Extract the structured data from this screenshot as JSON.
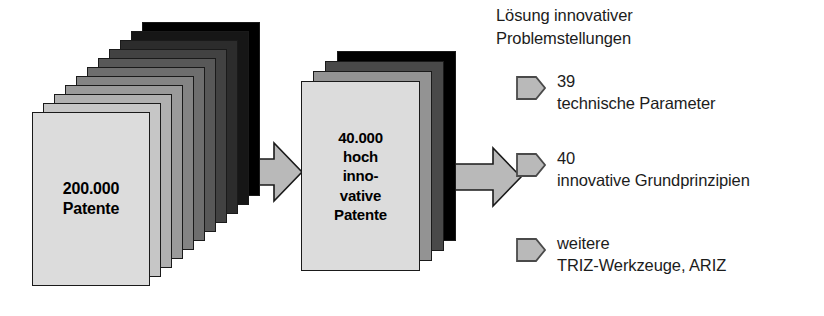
{
  "diagram": {
    "title_text_present": false,
    "background_color": "#ffffff",
    "ink_color": "#1a1a1a"
  },
  "stacks": [
    {
      "id": "patent-stack-large",
      "label": "200.000\nPatente",
      "sheet_count": 11,
      "front_fill": "#dcdcdc",
      "back_fill": "#000000",
      "font_size": 16,
      "geometry": {
        "left": 32,
        "top": 112,
        "width": 118,
        "height": 174,
        "offset_x": 11,
        "offset_y": -9
      }
    },
    {
      "id": "patent-stack-small",
      "label": "40.000\nhoch\ninno-\nvative\nPatente",
      "sheet_count": 4,
      "front_fill": "#dcdcdc",
      "back_fill": "#000000",
      "font_size": 15,
      "geometry": {
        "left": 301,
        "top": 81,
        "width": 119,
        "height": 190,
        "offset_x": 12,
        "offset_y": -10
      }
    }
  ],
  "arrows": [
    {
      "id": "arrow-stack-to-stack",
      "fill": "#b9b9b9",
      "stroke": "#1a1a1a",
      "geometry": {
        "left": 236,
        "top": 143,
        "width": 66,
        "height": 58
      }
    },
    {
      "id": "arrow-stack-to-outcomes",
      "fill": "#b9b9b9",
      "stroke": "#1a1a1a",
      "geometry": {
        "left": 455,
        "top": 148,
        "width": 66,
        "height": 58
      }
    }
  ],
  "outcomes": {
    "heading": "Lösung innovativer\nProblemstellungen",
    "marker_fill": "#b9b9b9",
    "marker_stroke": "#4a4a4a",
    "items": [
      {
        "count": "39",
        "description": "technische Parameter",
        "text": "39\ntechnische Parameter",
        "top": 70
      },
      {
        "count": "40",
        "description": "innovative Grundprinzipien",
        "text": "40\ninnovative Grundprinzipien",
        "top": 147
      },
      {
        "count": "",
        "description": "TRIZ-Werkzeuge, ARIZ",
        "text": "weitere\nTRIZ-Werkzeuge, ARIZ",
        "top": 232
      }
    ]
  }
}
